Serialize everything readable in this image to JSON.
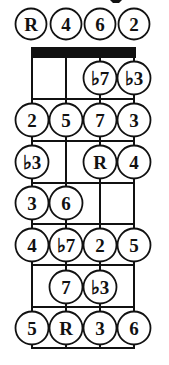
{
  "diagram": {
    "type": "fretboard-scale-chart",
    "strings": 4,
    "frets": 7,
    "colors": {
      "line": "#111111",
      "nut": "#111111",
      "circle_fill": "#ffffff",
      "text": "#111111"
    },
    "open_strings": [
      {
        "string": 0,
        "label": "R"
      },
      {
        "string": 1,
        "label": "4"
      },
      {
        "string": 2,
        "label": "6"
      },
      {
        "string": 3,
        "label": "2"
      }
    ],
    "notes": [
      {
        "fret": 1,
        "string": 2,
        "label": "♭7"
      },
      {
        "fret": 1,
        "string": 3,
        "label": "♭3"
      },
      {
        "fret": 2,
        "string": 0,
        "label": "2"
      },
      {
        "fret": 2,
        "string": 1,
        "label": "5"
      },
      {
        "fret": 2,
        "string": 2,
        "label": "7"
      },
      {
        "fret": 2,
        "string": 3,
        "label": "3"
      },
      {
        "fret": 3,
        "string": 0,
        "label": "♭3"
      },
      {
        "fret": 3,
        "string": 2,
        "label": "R"
      },
      {
        "fret": 3,
        "string": 3,
        "label": "4"
      },
      {
        "fret": 4,
        "string": 0,
        "label": "3"
      },
      {
        "fret": 4,
        "string": 1,
        "label": "6"
      },
      {
        "fret": 5,
        "string": 0,
        "label": "4"
      },
      {
        "fret": 5,
        "string": 1,
        "label": "♭7"
      },
      {
        "fret": 5,
        "string": 2,
        "label": "2"
      },
      {
        "fret": 5,
        "string": 3,
        "label": "5"
      },
      {
        "fret": 6,
        "string": 1,
        "label": "7"
      },
      {
        "fret": 6,
        "string": 2,
        "label": "♭3"
      },
      {
        "fret": 7,
        "string": 0,
        "label": "5"
      },
      {
        "fret": 7,
        "string": 1,
        "label": "R"
      },
      {
        "fret": 7,
        "string": 2,
        "label": "3"
      },
      {
        "fret": 7,
        "string": 3,
        "label": "6"
      }
    ]
  }
}
